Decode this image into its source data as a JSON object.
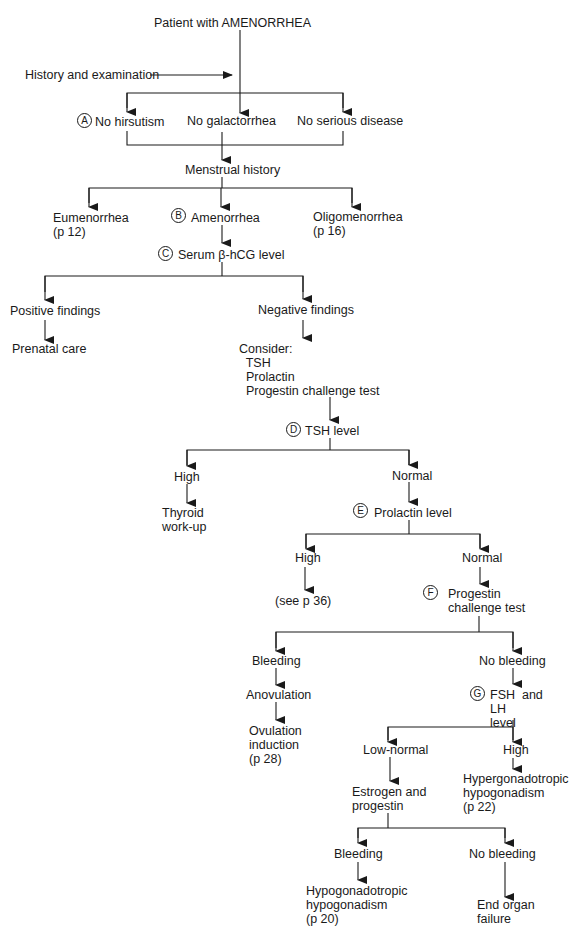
{
  "title": "Patient with AMENORRHEA",
  "nodes": {
    "root": "Patient with AMENORRHEA",
    "history_exam": "History and examination",
    "no_hirsutism": "No hirsutism",
    "no_galactorrhea": "No galactorrhea",
    "no_serious_disease": "No serious disease",
    "menstrual_history": "Menstrual history",
    "eumenorrhea": "Eumenorrhea\n(p 12)",
    "amenorrhea": "Amenorrhea",
    "oligomenorrhea": "Oligomenorrhea\n(p 16)",
    "serum_hcg": "Serum β-hCG level",
    "positive_findings": "Positive findings",
    "prenatal_care": "Prenatal care",
    "negative_findings": "Negative findings",
    "consider": "Consider:\n  TSH\n  Prolactin\n  Progestin challenge test",
    "tsh_level": "TSH level",
    "tsh_high": "High",
    "thyroid_workup": "Thyroid\nwork-up",
    "tsh_normal": "Normal",
    "prolactin_level": "Prolactin level",
    "prolactin_high": "High",
    "see_p36": "(see p 36)",
    "prolactin_normal": "Normal",
    "progestin_challenge": "Progestin\nchallenge test",
    "pct_bleeding": "Bleeding",
    "anovulation": "Anovulation",
    "ovulation_induction": "Ovulation\ninduction\n(p 28)",
    "pct_no_bleeding": "No bleeding",
    "fsh_lh": "FSH  and\nLH\nlevel",
    "low_normal": "Low-normal",
    "fsh_high": "High",
    "hypergonadotropic": "Hypergonadotropic\nhypogonadism\n(p 22)",
    "estrogen_progestin": "Estrogen and\nprogestin",
    "ep_bleeding": "Bleeding",
    "hypogonadotropic": "Hypogonadotropic\nhypogonadism\n(p 20)",
    "ep_no_bleeding": "No bleeding",
    "end_organ_failure": "End organ\nfailure"
  },
  "step_markers": [
    "A",
    "B",
    "C",
    "D",
    "E",
    "F",
    "G"
  ],
  "colors": {
    "ink": "#1a1a1a",
    "background": "#ffffff"
  }
}
